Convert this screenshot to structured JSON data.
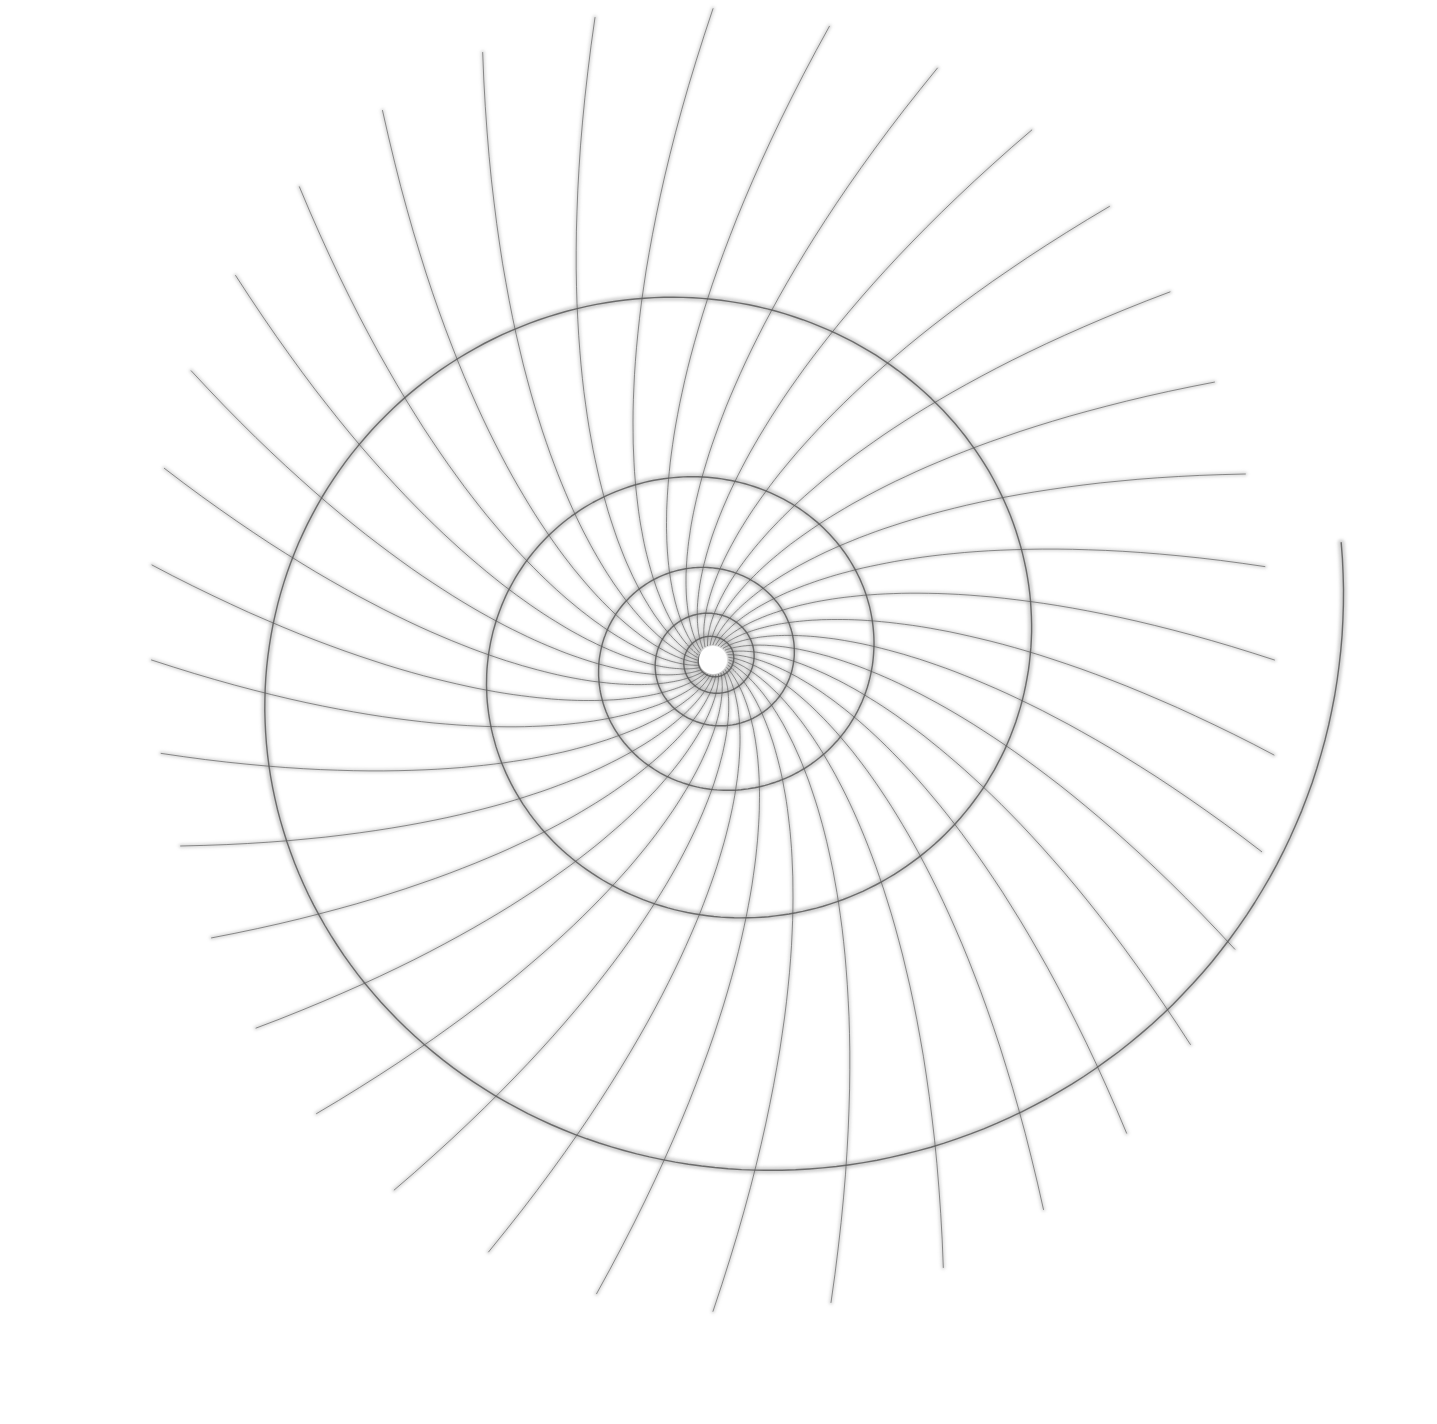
{
  "artwork": {
    "kind": "pencil drawing",
    "subject": "logarithmic spiral grid with curved radial rays",
    "background": "#ffffff",
    "stroke_color": "#5a5a5a",
    "halo_color": "#9a9a9a",
    "center": [
      713,
      660
    ],
    "aspect": [
      1.0,
      0.96
    ],
    "spiral": {
      "turns_inner_radius": 14,
      "outer_radius": 640,
      "turns": 5.6,
      "start_angle_deg": 205,
      "stroke_width": 2.6
    },
    "rays": {
      "count": 36,
      "inner_radius": 16,
      "outer_radius_min": 560,
      "outer_radius_max": 680,
      "twist_deg": 70,
      "stroke_width": 1.8
    }
  }
}
